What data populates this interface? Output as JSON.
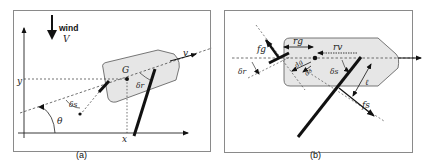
{
  "panel_a": {
    "caption": "(a)",
    "wind_label": "wind",
    "wind_speed_label": "V",
    "axis_x_label": "x",
    "axis_y_label": "y",
    "center_label": "G",
    "velocity_label": "v",
    "heading_angle_label": "θ",
    "sail_angle_label": "δs",
    "rudder_angle_label": "δr"
  },
  "panel_b": {
    "caption": "(b)",
    "rudder_force_label": "fg",
    "sail_force_label": "fs",
    "rudder_arm_label": "rg",
    "sail_arm_label": "rv",
    "rudder_offset_label": "dg",
    "sail_offset_label": "ds",
    "rudder_angle_label": "δr",
    "sail_angle_label": "δs",
    "sail_length_label": "ℓ"
  },
  "colors": {
    "frame": "#8a8a8a",
    "hull_fill": "#e6e6e6",
    "hull_stroke": "#555555",
    "ink": "#111111"
  }
}
